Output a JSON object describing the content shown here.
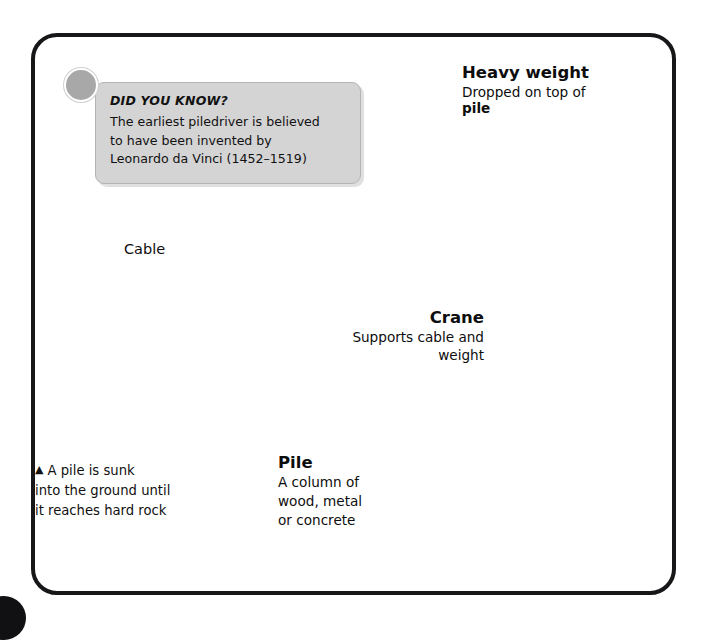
{
  "page": {
    "subject": "piledriver-diagram"
  },
  "fact_box": {
    "title": "DID YOU KNOW?",
    "line1": "The earliest piledriver is believed",
    "line2": "to have been invented by",
    "line3": "Leonardo da Vinci (1452–1519)"
  },
  "labels": {
    "heavy_weight": {
      "heading": "Heavy weight",
      "sub_prefix": "Dropped on top of ",
      "sub_bold": "pile"
    },
    "crane": {
      "heading": "Crane",
      "sub_line1": "Supports cable and",
      "sub_line2": "weight"
    },
    "cable": {
      "heading": "Cable"
    },
    "pile": {
      "heading": "Pile",
      "sub_line1": "A column of",
      "sub_line2": "wood, metal",
      "sub_line3": "or concrete"
    }
  },
  "caption": {
    "marker": "▲",
    "line1": "A pile is sunk",
    "line2": "into the ground until",
    "line3": "it reaches hard rock"
  },
  "colors": {
    "frame": "#17171a",
    "fact_box_fill": "#d4d4d4",
    "fact_box_border": "#b4b4b4",
    "badge_dot": "#a8a8a8",
    "metal_light": "#e3e3e0",
    "metal_mid": "#b9b9b4",
    "metal_dark": "#8c8c88",
    "truss_dark": "#6f6f6b",
    "ground": "#9a9a96",
    "text": "#0d0d0d"
  }
}
